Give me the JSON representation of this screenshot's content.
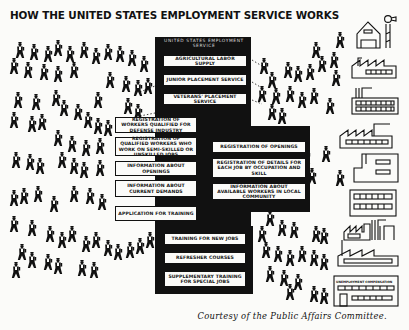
{
  "title": "HOW THE UNITED STATES EMPLOYMENT SERVICE WORKS",
  "central_agency": {
    "header": "United States Employment Service",
    "divisions": [
      {
        "label": "Agricultural Labor Supply"
      },
      {
        "label": "Junior Placement Service"
      },
      {
        "label": "Veterans' Placement Service"
      }
    ]
  },
  "worker_side": {
    "items": [
      {
        "label": "Registration of workers qualified for defense industry"
      },
      {
        "label": "Registration of qualified workers who work on semi-skilled or unskilled jobs"
      },
      {
        "label": "Information about openings"
      },
      {
        "label": "Information about current demands"
      },
      {
        "label": "Application for training"
      }
    ]
  },
  "employer_side": {
    "items": [
      {
        "label": "Registration of openings"
      },
      {
        "label": "Registration of details for each job by occupation and skill"
      },
      {
        "label": "Information about available workers in local community"
      }
    ]
  },
  "training": {
    "items": [
      {
        "label": "Training for new jobs"
      },
      {
        "label": "Refresher courses"
      },
      {
        "label": "Supplementary training for special jobs"
      }
    ]
  },
  "employers": {
    "buildings": [
      "farm-barn",
      "factory",
      "factory-smokestacks",
      "factory",
      "office-building",
      "office-building",
      "factory",
      "unemployment-compensation-office"
    ],
    "unemployment_sign": "Unemployment Compensation"
  },
  "caption": "Courtesy of the Public Affairs Committee."
}
